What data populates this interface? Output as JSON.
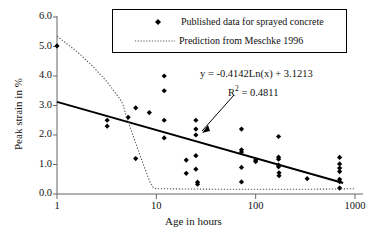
{
  "chart_data": {
    "type": "scatter",
    "title": "",
    "xlabel": "Age in hours",
    "ylabel": "Peak strain in %",
    "xscale": "log",
    "xlim": [
      1,
      1000
    ],
    "ylim": [
      0.0,
      6.0
    ],
    "xticks": [
      "1",
      "10",
      "100",
      "1000"
    ],
    "xtick_values": [
      1,
      10,
      100,
      1000
    ],
    "yticks": [
      "0.0",
      "1.0",
      "2.0",
      "3.0",
      "4.0",
      "5.0",
      "6.0"
    ],
    "ytick_values": [
      0.0,
      1.0,
      2.0,
      3.0,
      4.0,
      5.0,
      6.0
    ],
    "grid": false,
    "legend_position": "top-center",
    "legend": [
      {
        "label": "Published data for sprayed concrete",
        "marker": "diamond",
        "color": "#000000"
      },
      {
        "label": "Prediction from Meschke 1996",
        "marker": "dotted-line",
        "color": "#555555"
      }
    ],
    "annotations": [
      {
        "name": "trendline-equation",
        "text": "y = -0.4142Ln(x) + 3.1213"
      },
      {
        "name": "trendline-r2",
        "text": "R",
        "sup": "2",
        "rest": " = 0.4811"
      },
      {
        "name": "annotation-arrow",
        "text": ""
      }
    ],
    "series": [
      {
        "name": "Published data for sprayed concrete",
        "type": "scatter",
        "marker": "diamond",
        "color": "#000000",
        "points": [
          [
            1,
            5.02
          ],
          [
            3.2,
            2.5
          ],
          [
            3.2,
            2.3
          ],
          [
            5.2,
            2.6
          ],
          [
            6.2,
            2.92
          ],
          [
            6.2,
            1.2
          ],
          [
            8.5,
            2.76
          ],
          [
            12,
            4.0
          ],
          [
            12,
            3.5
          ],
          [
            12,
            2.5
          ],
          [
            12,
            1.9
          ],
          [
            20,
            1.15
          ],
          [
            20,
            0.7
          ],
          [
            25,
            2.5
          ],
          [
            25,
            2.2
          ],
          [
            25,
            2.0
          ],
          [
            25,
            1.3
          ],
          [
            25,
            0.84
          ],
          [
            26,
            0.4
          ],
          [
            26,
            0.33
          ],
          [
            72,
            2.2
          ],
          [
            72,
            1.5
          ],
          [
            72,
            1.42
          ],
          [
            72,
            0.9
          ],
          [
            72,
            0.41
          ],
          [
            100,
            1.15
          ],
          [
            100,
            1.1
          ],
          [
            170,
            1.95
          ],
          [
            170,
            1.25
          ],
          [
            170,
            1.18
          ],
          [
            170,
            0.98
          ],
          [
            170,
            0.92
          ],
          [
            172,
            0.72
          ],
          [
            172,
            0.62
          ],
          [
            330,
            0.52
          ],
          [
            700,
            1.24
          ],
          [
            700,
            1.02
          ],
          [
            700,
            0.88
          ],
          [
            700,
            0.76
          ],
          [
            700,
            0.5
          ],
          [
            700,
            0.42
          ],
          [
            700,
            0.2
          ]
        ]
      },
      {
        "name": "Trend line",
        "type": "line",
        "style": "solid",
        "color": "#000000",
        "equation": "y = -0.4142*Ln(x) + 3.1213",
        "slope": -0.4142,
        "intercept": 3.1213,
        "r_squared": 0.4811,
        "x_range": [
          1,
          760
        ]
      },
      {
        "name": "Prediction from Meschke 1996",
        "type": "line",
        "style": "dotted",
        "color": "#555555",
        "points": [
          [
            1,
            5.35
          ],
          [
            1.6,
            4.82
          ],
          [
            2.3,
            4.32
          ],
          [
            3.2,
            3.8
          ],
          [
            4.3,
            3.22
          ],
          [
            4.6,
            3.05
          ],
          [
            5.0,
            2.62
          ],
          [
            5.6,
            2.15
          ],
          [
            6.3,
            1.66
          ],
          [
            7.0,
            1.22
          ],
          [
            7.8,
            0.8
          ],
          [
            8.6,
            0.42
          ],
          [
            9.3,
            0.22
          ],
          [
            10,
            0.18
          ],
          [
            20,
            0.17
          ],
          [
            50,
            0.16
          ],
          [
            100,
            0.16
          ],
          [
            300,
            0.16
          ],
          [
            700,
            0.17
          ],
          [
            1000,
            0.18
          ]
        ]
      }
    ]
  },
  "axis": {
    "y_title": "Peak strain in %",
    "x_title": "Age in hours"
  }
}
